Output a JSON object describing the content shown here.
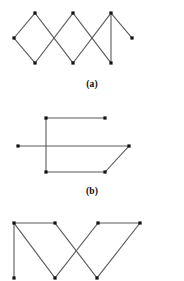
{
  "page": {
    "background_color": "#ffffff",
    "width": 184,
    "height": 281
  },
  "style": {
    "edge_color": "#5a5a5a",
    "edge_width": 1.1,
    "vertex_color": "#111111",
    "vertex_size": 3.2,
    "caption_color": "#0b0b0b"
  },
  "figures": [
    {
      "id": "a",
      "caption": "(a)",
      "description": "Three overlapping diamonds forming a zig-zag chain of degree-2 vertices plus two pendant vertices",
      "viewbox": "0 0 184 78",
      "vertices": [
        {
          "name": "a-v1",
          "x": 14,
          "y": 38
        },
        {
          "name": "a-v2",
          "x": 35,
          "y": 13
        },
        {
          "name": "a-v3",
          "x": 35,
          "y": 63
        },
        {
          "name": "a-v4",
          "x": 73,
          "y": 13
        },
        {
          "name": "a-v5",
          "x": 73,
          "y": 63
        },
        {
          "name": "a-v6",
          "x": 111,
          "y": 13
        },
        {
          "name": "a-v7",
          "x": 111,
          "y": 63
        },
        {
          "name": "a-v8",
          "x": 132,
          "y": 38
        }
      ],
      "edges": [
        {
          "from": 0,
          "to": 1
        },
        {
          "from": 0,
          "to": 2
        },
        {
          "from": 1,
          "to": 4
        },
        {
          "from": 2,
          "to": 3
        },
        {
          "from": 3,
          "to": 6
        },
        {
          "from": 4,
          "to": 5
        },
        {
          "from": 5,
          "to": 7
        },
        {
          "from": 6,
          "to": 5
        }
      ]
    },
    {
      "id": "b",
      "caption": "(b)",
      "description": "Rectangle-like graph with one long horizontal edge crossing a vertical edge, a slanted edge on the right, and two pendant endpoints",
      "viewbox": "0 0 184 80",
      "vertices": [
        {
          "name": "b-v1",
          "x": 18,
          "y": 41
        },
        {
          "name": "b-v2",
          "x": 46,
          "y": 13
        },
        {
          "name": "b-v3",
          "x": 46,
          "y": 67
        },
        {
          "name": "b-v4",
          "x": 105,
          "y": 13
        },
        {
          "name": "b-v5",
          "x": 105,
          "y": 67
        },
        {
          "name": "b-v6",
          "x": 129,
          "y": 41
        }
      ],
      "edges": [
        {
          "from": 0,
          "to": 5
        },
        {
          "from": 1,
          "to": 2
        },
        {
          "from": 1,
          "to": 3
        },
        {
          "from": 2,
          "to": 4
        },
        {
          "from": 4,
          "to": 5
        }
      ]
    },
    {
      "id": "c",
      "caption": "",
      "description": "Two W-shaped zig-zags crossing, with four top vertices, three bottom vertices and one vertical pendant edge on the left",
      "viewbox": "0 0 184 69",
      "vertices": [
        {
          "name": "c-v1",
          "x": 14,
          "y": 11
        },
        {
          "name": "c-v2",
          "x": 55,
          "y": 11
        },
        {
          "name": "c-v3",
          "x": 98,
          "y": 11
        },
        {
          "name": "c-v4",
          "x": 140,
          "y": 11
        },
        {
          "name": "c-v5",
          "x": 14,
          "y": 66
        },
        {
          "name": "c-v6",
          "x": 55,
          "y": 66
        },
        {
          "name": "c-v7",
          "x": 97,
          "y": 66
        }
      ],
      "edges": [
        {
          "from": 0,
          "to": 1
        },
        {
          "from": 2,
          "to": 3
        },
        {
          "from": 0,
          "to": 4
        },
        {
          "from": 0,
          "to": 5
        },
        {
          "from": 1,
          "to": 6
        },
        {
          "from": 2,
          "to": 5
        },
        {
          "from": 3,
          "to": 6
        }
      ]
    }
  ]
}
